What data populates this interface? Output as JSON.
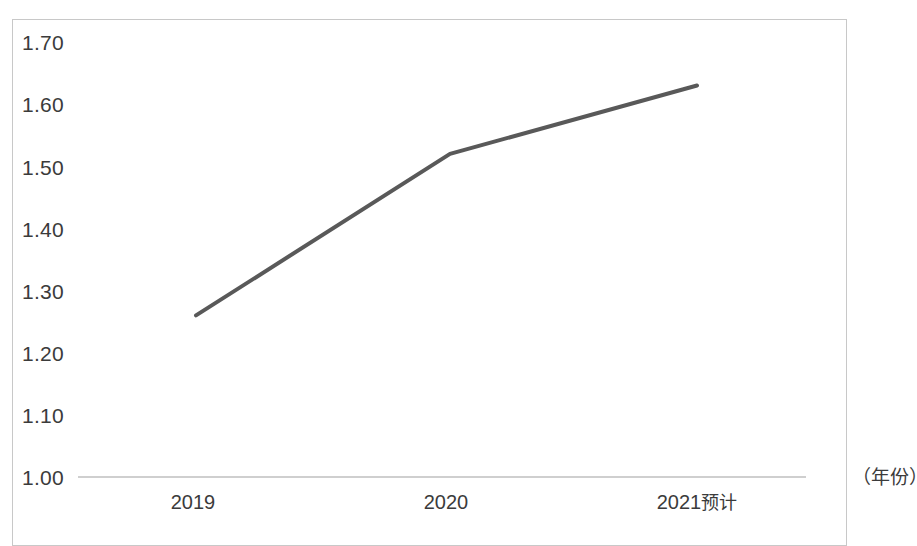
{
  "chart_data": {
    "type": "line",
    "title": "",
    "subtitle": "",
    "xlabel": "（年份）",
    "ylabel": "",
    "categories": [
      "2019",
      "2020",
      "2021预计"
    ],
    "values": [
      1.26,
      1.52,
      1.63
    ],
    "series": [
      {
        "name": "",
        "values": [
          1.26,
          1.52,
          1.63
        ],
        "color": "#595959"
      }
    ],
    "ylim": [
      1.0,
      1.7
    ],
    "ytick_labels": [
      "1.70",
      "1.60",
      "1.50",
      "1.40",
      "1.30",
      "1.20",
      "1.10",
      "1.00"
    ],
    "ytick_values": [
      1.7,
      1.6,
      1.5,
      1.4,
      1.3,
      1.2,
      1.1,
      1.0
    ],
    "xtick_labels": [
      "2019",
      "2020",
      "2021预计"
    ],
    "grid": false,
    "legend": "none",
    "axis_line_color": "#bfbfbf",
    "frame_color": "#c8c8c8",
    "line_color": "#595959",
    "line_width": 4,
    "marker": "none",
    "background": "#ffffff"
  },
  "axis": {
    "unit_label": "（年份）"
  },
  "xticks": [
    {
      "label": "2019",
      "suffix": ""
    },
    {
      "label": "2020",
      "suffix": ""
    },
    {
      "label": "2021",
      "suffix": "预计"
    }
  ],
  "yticks": [
    {
      "label": "1.70"
    },
    {
      "label": "1.60"
    },
    {
      "label": "1.50"
    },
    {
      "label": "1.40"
    },
    {
      "label": "1.30"
    },
    {
      "label": "1.20"
    },
    {
      "label": "1.10"
    },
    {
      "label": "1.00"
    }
  ]
}
